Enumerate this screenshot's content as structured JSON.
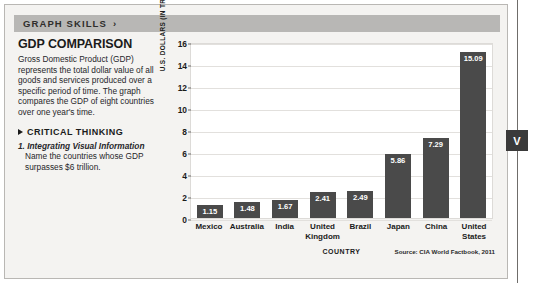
{
  "header": {
    "title": "GRAPH SKILLS",
    "arrow_icon": "chevron-right-icon",
    "arrow_glyph": "›"
  },
  "left_panel": {
    "heading": "GDP COMPARISON",
    "body": "Gross Domestic Product (GDP) represents the total dollar value of all goods and services produced over a specific period of time. The graph compares the GDP of eight countries over one year's time.",
    "critical_thinking_label": "CRITICAL THINKING",
    "critical_thinking_icon": "triangle-right-icon",
    "question_number": "1.",
    "question_bold": "Integrating Visual Information",
    "question_text": "Name the countries whose GDP surpasses $6 trillion."
  },
  "chart_data": {
    "type": "bar",
    "title": "GDP COMPARISON",
    "xlabel": "COUNTRY",
    "ylabel": "U.S. DOLLARS (IN TRILLIONS)",
    "categories": [
      "Mexico",
      "Australia",
      "India",
      "United Kingdom",
      "Brazil",
      "Japan",
      "China",
      "United States"
    ],
    "values": [
      1.15,
      1.48,
      1.67,
      2.41,
      2.49,
      5.86,
      7.29,
      15.09
    ],
    "value_labels": [
      "1.15",
      "1.48",
      "1.67",
      "2.41",
      "2.49",
      "5.86",
      "7.29",
      "15.09"
    ],
    "ylim": [
      0,
      16
    ],
    "yticks": [
      16,
      14,
      12,
      10,
      8,
      6,
      4,
      2,
      0
    ],
    "ytick_labels": [
      "16",
      "14",
      "12",
      "10",
      "8",
      "6",
      "4",
      "2",
      "0"
    ],
    "grid": true,
    "legend": null,
    "source_note": "Source: CIA World Factbook, 2011",
    "bar_color": "#4a4a4a",
    "plot_background": "#ffffff",
    "gridline_color": "#e2e0dd"
  },
  "edge_marker": {
    "label": "V"
  }
}
